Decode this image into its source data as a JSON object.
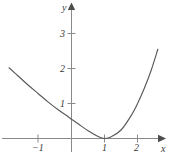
{
  "chart_data": {
    "type": "line",
    "title": "",
    "xlabel": "x",
    "ylabel": "y",
    "grid": false,
    "legend": null,
    "xlim": [
      -1.9,
      2.65
    ],
    "ylim": [
      -0.25,
      3.45
    ],
    "xticks": [
      -1,
      1,
      2
    ],
    "xticklabels": [
      "−1",
      "1",
      "2"
    ],
    "yticks": [
      1,
      2,
      3
    ],
    "yticklabels": [
      "1",
      "2",
      "3"
    ],
    "axis_color": "#7a7a7a",
    "curve_color": "#595959",
    "series": [
      {
        "name": "curve",
        "comment": "U-shaped curve with minimum touching the x-axis at x = 1",
        "x": [
          -1.88,
          -1.6,
          -1.3,
          -1.0,
          -0.7,
          -0.4,
          -0.1,
          0.0,
          0.2,
          0.5,
          0.8,
          1.0,
          1.2,
          1.5,
          1.8,
          2.0,
          2.2,
          2.4,
          2.6
        ],
        "y": [
          2.02,
          1.78,
          1.52,
          1.28,
          1.04,
          0.82,
          0.62,
          0.55,
          0.42,
          0.22,
          0.06,
          0.0,
          0.05,
          0.25,
          0.66,
          1.02,
          1.45,
          1.95,
          2.55
        ]
      }
    ],
    "annotations": []
  },
  "axes": {
    "x_axis_name": "x-axis",
    "y_axis_name": "y-axis",
    "x_label": "x",
    "y_label": "y",
    "x_tick_1_label": "−1",
    "x_tick_2_label": "1",
    "x_tick_3_label": "2",
    "y_tick_1_label": "1",
    "y_tick_2_label": "2",
    "y_tick_3_label": "3"
  }
}
